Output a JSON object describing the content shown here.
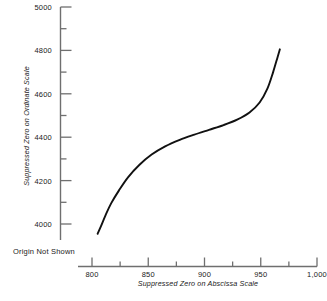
{
  "chart_data": {
    "type": "line",
    "title": "",
    "xlabel": "Suppressed Zero on Abscissa Scale",
    "ylabel": "Suppressed Zero on Ordinate Scale",
    "annotation": "Origin Not Shown",
    "xlim": [
      800,
      1000
    ],
    "ylim": [
      4000,
      5000
    ],
    "grid": false,
    "legend": null,
    "x_major_ticks": [
      800,
      850,
      900,
      950,
      1000
    ],
    "x_major_tick_labels": [
      "800",
      "850",
      "900",
      "950",
      "1,000"
    ],
    "x_minor_ticks": [
      825,
      875,
      925,
      975
    ],
    "y_major_ticks": [
      4000,
      4200,
      4400,
      4600,
      4800,
      5000
    ],
    "y_major_tick_labels": [
      "4000",
      "4200",
      "4400",
      "4600",
      "4800",
      "5000"
    ],
    "y_minor_ticks": [
      4100,
      4300,
      4500,
      4700,
      4900
    ],
    "series": [
      {
        "name": "curve",
        "color": "#111111",
        "x": [
          805,
          808,
          812,
          817,
          824,
          832,
          842,
          853,
          865,
          878,
          891,
          904,
          917,
          929,
          940,
          949,
          956,
          961,
          965,
          967
        ],
        "y": [
          3955,
          3990,
          4040,
          4095,
          4155,
          4215,
          4272,
          4320,
          4358,
          4388,
          4412,
          4434,
          4456,
          4481,
          4514,
          4560,
          4625,
          4700,
          4770,
          4805
        ]
      }
    ]
  },
  "axes": {
    "y_axis_name": "ordinate-axis",
    "x_axis_name": "abscissa-axis"
  },
  "colors": {
    "background": "#ffffff",
    "axis": "#6f6f6f",
    "curve": "#111111",
    "text": "#1a1a1a"
  }
}
